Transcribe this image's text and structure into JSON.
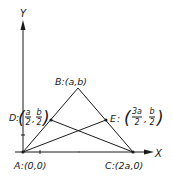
{
  "diagram": {
    "axes": {
      "x_label": "X",
      "y_label": "Y"
    },
    "points": {
      "A": {
        "name": "A",
        "coords": "(0,0)"
      },
      "B": {
        "name": "B",
        "coords": "(a,b)"
      },
      "C": {
        "name": "C",
        "coords": "(2a,0)"
      },
      "D": {
        "name": "D",
        "x_num": "a",
        "x_den": "2",
        "y_num": "b",
        "y_den": "2"
      },
      "E": {
        "name": "E",
        "x_num": "3a",
        "x_den": "2",
        "y_num": "b",
        "y_den": "2"
      }
    },
    "segments": [
      "AB",
      "BC",
      "AC",
      "AE",
      "CD"
    ]
  }
}
